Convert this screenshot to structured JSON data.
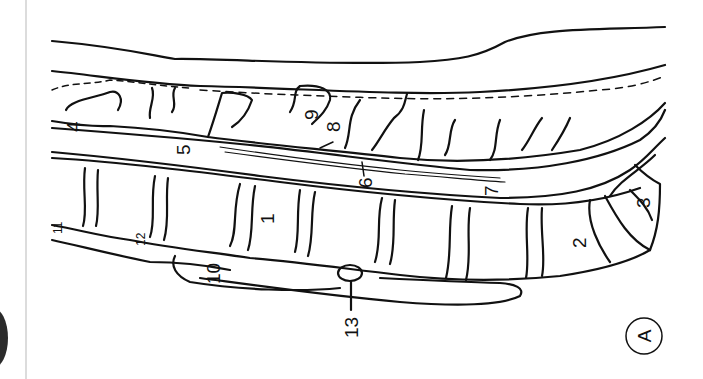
{
  "viewer": {
    "left_panel": {
      "blob": "dark-circle-partial"
    },
    "divider_color": "#dcdcdc"
  },
  "figure": {
    "panel_label": "A",
    "orientation": "rotated 90 degrees counter-clockwise",
    "labels": [
      {
        "id": "1",
        "text": "1"
      },
      {
        "id": "2",
        "text": "2"
      },
      {
        "id": "3",
        "text": "3"
      },
      {
        "id": "4",
        "text": "4"
      },
      {
        "id": "5",
        "text": "5"
      },
      {
        "id": "6",
        "text": "6"
      },
      {
        "id": "7",
        "text": "7"
      },
      {
        "id": "8",
        "text": "8"
      },
      {
        "id": "9",
        "text": "9"
      },
      {
        "id": "10",
        "text": "10"
      },
      {
        "id": "11",
        "text": "11"
      },
      {
        "id": "12",
        "text": "12"
      },
      {
        "id": "13",
        "text": "13"
      }
    ],
    "line_color": "#111111"
  }
}
